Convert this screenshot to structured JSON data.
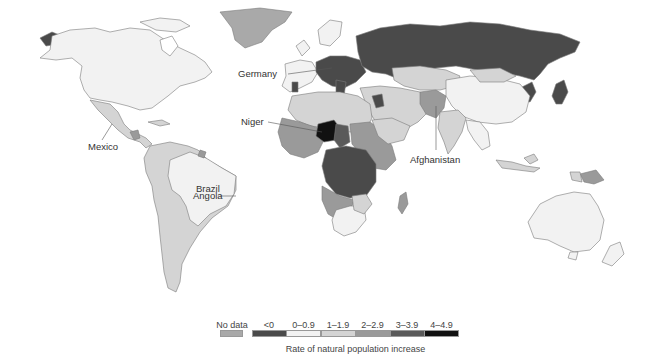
{
  "map": {
    "title": "Rate of natural population increase",
    "labels": [
      {
        "id": "germany",
        "text": "Germany"
      },
      {
        "id": "niger",
        "text": "Niger"
      },
      {
        "id": "mexico",
        "text": "Mexico"
      },
      {
        "id": "brazil",
        "text": "Brazil"
      },
      {
        "id": "angola",
        "text": "Angola"
      },
      {
        "id": "afghanistan",
        "text": "Afghanistan"
      }
    ]
  },
  "legend": {
    "title": "Rate of natural population increase",
    "no_data": {
      "label": "No data",
      "color": "#a9a9a9"
    },
    "bins": [
      {
        "label": "<0",
        "color": "#4a4a4a"
      },
      {
        "label": "0–0.9",
        "color": "#f2f2f2"
      },
      {
        "label": "1–1.9",
        "color": "#d4d4d4"
      },
      {
        "label": "2–2.9",
        "color": "#9a9a9a"
      },
      {
        "label": "3–3.9",
        "color": "#5a5a5a"
      },
      {
        "label": "4–4.9",
        "color": "#111111"
      }
    ]
  },
  "colors": {
    "ocean": "#ffffff",
    "border": "#777777"
  }
}
